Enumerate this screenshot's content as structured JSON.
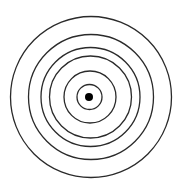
{
  "diagram": {
    "type": "concentric-circles",
    "ring_count": 6,
    "has_center_dot": true,
    "colors": {
      "background": "#ffffff",
      "stroke": "#2a2a2a",
      "center_dot": "#000000"
    }
  }
}
